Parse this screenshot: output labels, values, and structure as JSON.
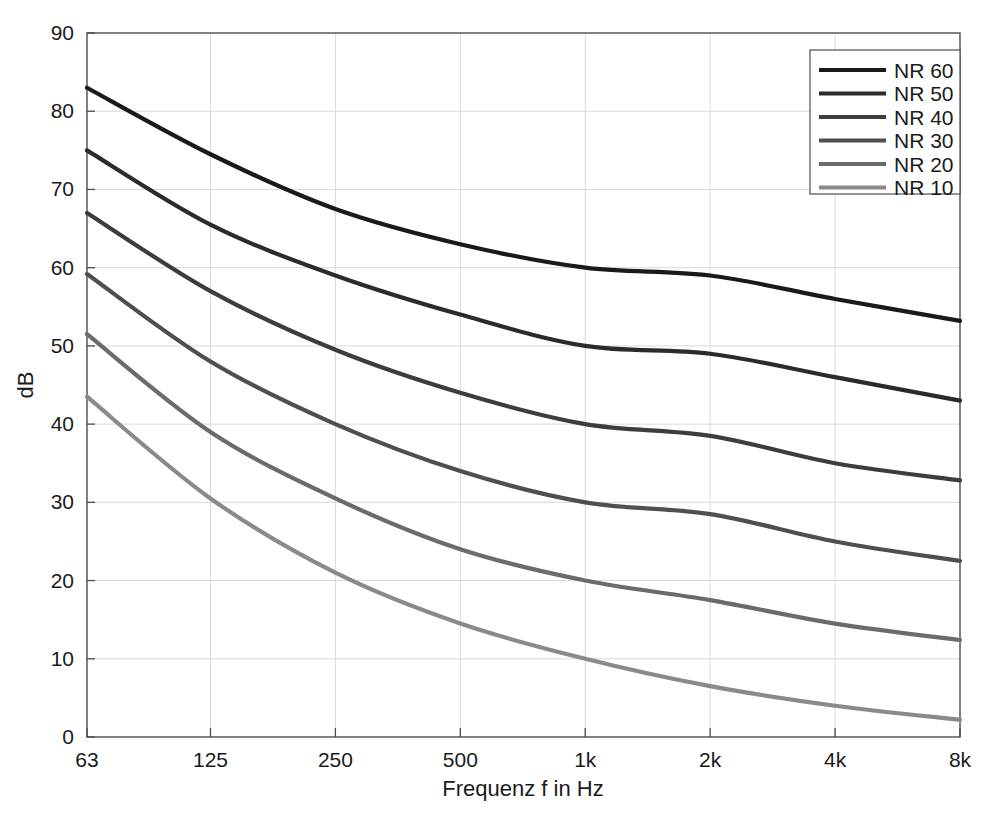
{
  "chart_data": {
    "type": "line",
    "title": "",
    "xlabel": "Frequenz f in Hz",
    "ylabel": "dB",
    "x_tick_labels": [
      "63",
      "125",
      "250",
      "500",
      "1k",
      "2k",
      "4k",
      "8k"
    ],
    "x_values": [
      63,
      125,
      250,
      500,
      1000,
      2000,
      4000,
      8000
    ],
    "y_tick_labels": [
      "0",
      "10",
      "20",
      "30",
      "40",
      "50",
      "60",
      "70",
      "80",
      "90"
    ],
    "y_ticks": [
      0,
      10,
      20,
      30,
      40,
      50,
      60,
      70,
      80,
      90
    ],
    "ylim": [
      0,
      90
    ],
    "xscale": "log",
    "grid": true,
    "legend_position": "top-right",
    "series": [
      {
        "name": "NR 60",
        "color": "#1a1a1a",
        "values": [
          83.0,
          74.5,
          67.5,
          63.0,
          60.0,
          59.0,
          56.0,
          53.2
        ]
      },
      {
        "name": "NR 50",
        "color": "#2b2b2b",
        "values": [
          75.0,
          65.5,
          59.0,
          54.0,
          50.0,
          49.0,
          46.0,
          43.0
        ]
      },
      {
        "name": "NR 40",
        "color": "#3d3d3d",
        "values": [
          67.0,
          57.0,
          49.5,
          44.0,
          40.0,
          38.5,
          35.0,
          32.8
        ]
      },
      {
        "name": "NR 30",
        "color": "#4f4f4f",
        "values": [
          59.2,
          48.0,
          40.0,
          34.0,
          30.0,
          28.5,
          25.0,
          22.5
        ]
      },
      {
        "name": "NR 20",
        "color": "#6b6b6b",
        "values": [
          51.5,
          39.0,
          30.5,
          24.0,
          20.0,
          17.5,
          14.5,
          12.4
        ]
      },
      {
        "name": "NR 10",
        "color": "#8a8a8a",
        "values": [
          43.5,
          30.5,
          21.0,
          14.5,
          10.0,
          6.5,
          4.0,
          2.2
        ]
      }
    ]
  },
  "axes": {
    "frame_color": "#4d4d4d",
    "grid_color": "#d9d9d9"
  }
}
